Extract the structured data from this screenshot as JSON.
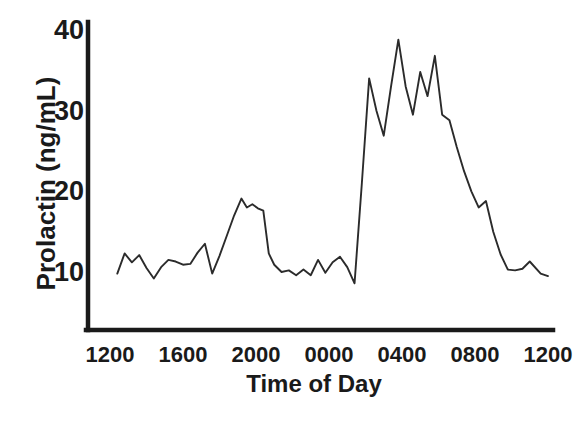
{
  "chart_data": {
    "type": "line",
    "title": "",
    "subtitle": "",
    "xlabel": "Time of Day",
    "ylabel": "Prolactin  (ng/mL)",
    "xlim": [
      1200,
      3600
    ],
    "ylim": [
      6,
      41
    ],
    "grid": false,
    "legend": null,
    "annotations": [],
    "y_ticks": [
      {
        "value": 10,
        "label": "10"
      },
      {
        "value": 20,
        "label": "20"
      },
      {
        "value": 30,
        "label": "30"
      },
      {
        "value": 40,
        "label": "40"
      }
    ],
    "x_ticks": [
      {
        "value": 1200,
        "label": "1200"
      },
      {
        "value": 1600,
        "label": "1600"
      },
      {
        "value": 2000,
        "label": "2000"
      },
      {
        "value": 2400,
        "label": "0000"
      },
      {
        "value": 2800,
        "label": "0400"
      },
      {
        "value": 3200,
        "label": "0800"
      },
      {
        "value": 3600,
        "label": "1200"
      }
    ],
    "series": [
      {
        "name": "Prolactin",
        "color": "#2b2b2b",
        "x": [
          1240,
          1280,
          1320,
          1360,
          1400,
          1440,
          1480,
          1520,
          1560,
          1600,
          1640,
          1680,
          1720,
          1760,
          1800,
          1840,
          1880,
          1920,
          1950,
          1980,
          2010,
          2040,
          2070,
          2100,
          2140,
          2180,
          2220,
          2260,
          2300,
          2340,
          2380,
          2420,
          2460,
          2500,
          2540,
          2580,
          2620,
          2660,
          2700,
          2740,
          2780,
          2820,
          2860,
          2900,
          2940,
          2980,
          3020,
          3060,
          3100,
          3140,
          3180,
          3220,
          3260,
          3300,
          3340,
          3380,
          3420,
          3460,
          3500,
          3560,
          3600
        ],
        "y": [
          9.8,
          12.3,
          11.2,
          12.1,
          10.5,
          9.2,
          10.6,
          11.5,
          11.3,
          10.9,
          11.0,
          12.4,
          13.5,
          9.8,
          12.0,
          14.5,
          17.0,
          19.1,
          18.0,
          18.4,
          17.9,
          17.6,
          12.3,
          10.9,
          10.0,
          10.2,
          9.6,
          10.3,
          9.6,
          11.5,
          9.9,
          11.2,
          11.9,
          10.6,
          8.6,
          21.0,
          34.0,
          30.0,
          26.9,
          33.0,
          38.8,
          33.0,
          29.5,
          34.8,
          31.8,
          36.8,
          29.5,
          28.8,
          25.5,
          22.5,
          20.0,
          18.0,
          18.8,
          15.0,
          12.2,
          10.3,
          10.2,
          10.4,
          11.3,
          9.8,
          9.5
        ]
      }
    ]
  },
  "axes": {
    "y_axis_line": true,
    "x_axis_line": true,
    "line_color": "#1a1a1a"
  }
}
